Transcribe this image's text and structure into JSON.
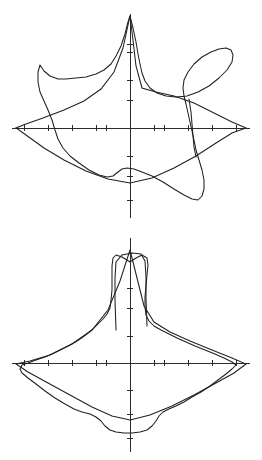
{
  "page": {
    "background_color": "#ffffff",
    "trace_color": "#231f20",
    "axis_color": "#2b2b2b",
    "figure_count": 2
  },
  "chart_data": [
    {
      "type": "line",
      "name": "upper-polar-plot",
      "title": "",
      "subtitle": "",
      "xlabel": "",
      "ylabel": "",
      "coordinate_system": "cartesian-crosshair",
      "grid": false,
      "legend": "none",
      "origin": {
        "x": 130,
        "y": 128
      },
      "axis": {
        "x_extent": [
          12,
          250
        ],
        "y_extent": [
          14,
          218
        ],
        "x_ticks": [
          24,
          48,
          72,
          96,
          106,
          154,
          164,
          188,
          212,
          236
        ],
        "y_ticks": [
          44,
          52,
          80,
          100,
          156,
          176,
          200
        ],
        "tick_length": 6,
        "tick_labels": [],
        "axis_labels_shown": false
      },
      "series": [
        {
          "name": "smooth-contour",
          "style": "smooth",
          "points": [
            [
              130,
              16
            ],
            [
              128,
              22
            ],
            [
              125,
              34
            ],
            [
              121,
              46
            ],
            [
              116,
              56
            ],
            [
              111,
              64
            ],
            [
              104,
              70
            ],
            [
              96,
              74
            ],
            [
              86,
              77
            ],
            [
              76,
              78
            ],
            [
              66,
              79
            ],
            [
              58,
              79
            ],
            [
              50,
              76
            ],
            [
              44,
              71
            ],
            [
              40,
              65
            ],
            [
              38,
              72
            ],
            [
              38,
              82
            ],
            [
              40,
              92
            ],
            [
              44,
              101
            ],
            [
              48,
              110
            ],
            [
              52,
              120
            ],
            [
              55,
              130
            ],
            [
              58,
              139
            ],
            [
              63,
              148
            ],
            [
              70,
              156
            ],
            [
              79,
              163
            ],
            [
              89,
              170
            ],
            [
              99,
              175
            ],
            [
              107,
              177
            ],
            [
              113,
              176
            ],
            [
              118,
              172
            ],
            [
              122,
              169
            ],
            [
              127,
              168
            ],
            [
              134,
              169
            ],
            [
              142,
              172
            ],
            [
              152,
              176
            ],
            [
              163,
              182
            ],
            [
              174,
              189
            ],
            [
              184,
              195
            ],
            [
              192,
              199
            ],
            [
              198,
              200
            ],
            [
              202,
              196
            ],
            [
              204,
              189
            ],
            [
              204,
              180
            ],
            [
              202,
              170
            ],
            [
              199,
              160
            ],
            [
              196,
              150
            ],
            [
              194,
              140
            ],
            [
              192,
              131
            ],
            [
              190,
              122
            ],
            [
              188,
              113
            ],
            [
              186,
              104
            ],
            [
              184,
              96
            ],
            [
              183,
              88
            ],
            [
              184,
              80
            ],
            [
              188,
              72
            ],
            [
              194,
              64
            ],
            [
              202,
              57
            ],
            [
              211,
              52
            ],
            [
              219,
              49
            ],
            [
              226,
              48
            ],
            [
              231,
              50
            ],
            [
              233,
              55
            ],
            [
              232,
              62
            ],
            [
              227,
              70
            ],
            [
              219,
              78
            ],
            [
              209,
              86
            ],
            [
              198,
              92
            ],
            [
              187,
              96
            ],
            [
              176,
              97
            ],
            [
              166,
              96
            ],
            [
              157,
              93
            ],
            [
              150,
              88
            ],
            [
              145,
              81
            ],
            [
              142,
              73
            ],
            [
              140,
              64
            ],
            [
              138,
              54
            ],
            [
              136,
              42
            ],
            [
              133,
              28
            ],
            [
              130,
              16
            ]
          ]
        },
        {
          "name": "polygonal-contour",
          "style": "angular",
          "points": [
            [
              130,
              16
            ],
            [
              123,
              48
            ],
            [
              114,
              72
            ],
            [
              101,
              89
            ],
            [
              84,
              101
            ],
            [
              64,
              110
            ],
            [
              43,
              118
            ],
            [
              26,
              124
            ],
            [
              16,
              128
            ],
            [
              26,
              135
            ],
            [
              44,
              148
            ],
            [
              64,
              160
            ],
            [
              86,
              171
            ],
            [
              108,
              179
            ],
            [
              130,
              183
            ],
            [
              152,
              178
            ],
            [
              174,
              168
            ],
            [
              196,
              156
            ],
            [
              216,
              143
            ],
            [
              232,
              133
            ],
            [
              246,
              128
            ],
            [
              232,
              122
            ],
            [
              214,
              113
            ],
            [
              194,
              103
            ],
            [
              174,
              96
            ],
            [
              156,
              92
            ],
            [
              142,
              88
            ],
            [
              136,
              66
            ],
            [
              133,
              40
            ],
            [
              130,
              16
            ]
          ]
        },
        {
          "name": "inner-radial-spur",
          "style": "angular",
          "points": [
            [
              189,
              99
            ],
            [
              191,
              112
            ],
            [
              192,
              124
            ],
            [
              193,
              136
            ],
            [
              194,
              147
            ],
            [
              196,
              157
            ]
          ]
        }
      ]
    },
    {
      "type": "line",
      "name": "lower-polar-plot",
      "title": "",
      "subtitle": "",
      "xlabel": "",
      "ylabel": "",
      "coordinate_system": "cartesian-crosshair",
      "grid": false,
      "legend": "none",
      "origin": {
        "x": 130,
        "y": 363
      },
      "axis": {
        "x_extent": [
          12,
          250
        ],
        "y_extent": [
          238,
          452
        ],
        "x_ticks": [
          24,
          48,
          72,
          96,
          106,
          154,
          164,
          188,
          212,
          236
        ],
        "y_ticks": [
          288,
          308,
          336,
          390,
          414,
          438
        ],
        "tick_length": 6,
        "tick_labels": [],
        "axis_labels_shown": false
      },
      "series": [
        {
          "name": "smooth-contour",
          "style": "smooth",
          "points": [
            [
              130,
              262
            ],
            [
              122,
              257
            ],
            [
              116,
              255
            ],
            [
              113,
              258
            ],
            [
              112,
              266
            ],
            [
              112,
              278
            ],
            [
              112,
              290
            ],
            [
              111,
              300
            ],
            [
              110,
              308
            ],
            [
              107,
              314
            ],
            [
              103,
              319
            ],
            [
              98,
              324
            ],
            [
              93,
              329
            ],
            [
              88,
              333
            ],
            [
              83,
              337
            ],
            [
              77,
              341
            ],
            [
              70,
              345
            ],
            [
              62,
              349
            ],
            [
              54,
              353
            ],
            [
              45,
              357
            ],
            [
              36,
              360
            ],
            [
              28,
              363
            ],
            [
              22,
              365
            ],
            [
              20,
              369
            ],
            [
              22,
              373
            ],
            [
              28,
              378
            ],
            [
              36,
              384
            ],
            [
              45,
              391
            ],
            [
              55,
              398
            ],
            [
              65,
              404
            ],
            [
              74,
              409
            ],
            [
              82,
              412
            ],
            [
              90,
              414
            ],
            [
              96,
              417
            ],
            [
              101,
              421
            ],
            [
              105,
              426
            ],
            [
              110,
              430
            ],
            [
              116,
              432
            ],
            [
              124,
              433
            ],
            [
              132,
              433
            ],
            [
              140,
              432
            ],
            [
              147,
              430
            ],
            [
              152,
              426
            ],
            [
              156,
              421
            ],
            [
              159,
              416
            ],
            [
              163,
              412
            ],
            [
              169,
              409
            ],
            [
              176,
              406
            ],
            [
              184,
              402
            ],
            [
              192,
              397
            ],
            [
              201,
              392
            ],
            [
              210,
              386
            ],
            [
              218,
              380
            ],
            [
              226,
              374
            ],
            [
              232,
              369
            ],
            [
              236,
              365
            ],
            [
              232,
              362
            ],
            [
              224,
              358
            ],
            [
              215,
              354
            ],
            [
              205,
              350
            ],
            [
              195,
              346
            ],
            [
              186,
              342
            ],
            [
              177,
              338
            ],
            [
              169,
              334
            ],
            [
              161,
              330
            ],
            [
              154,
              326
            ],
            [
              149,
              321
            ],
            [
              146,
              315
            ],
            [
              145,
              307
            ],
            [
              145,
              297
            ],
            [
              146,
              286
            ],
            [
              147,
              275
            ],
            [
              148,
              265
            ],
            [
              147,
              258
            ],
            [
              142,
              255
            ],
            [
              136,
              258
            ],
            [
              130,
              262
            ]
          ]
        },
        {
          "name": "polygonal-contour",
          "style": "angular",
          "points": [
            [
              130,
              250
            ],
            [
              120,
              281
            ],
            [
              108,
              310
            ],
            [
              92,
              330
            ],
            [
              72,
              344
            ],
            [
              50,
              355
            ],
            [
              30,
              361
            ],
            [
              16,
              364
            ],
            [
              28,
              372
            ],
            [
              48,
              383
            ],
            [
              70,
              395
            ],
            [
              92,
              407
            ],
            [
              112,
              416
            ],
            [
              130,
              420
            ],
            [
              150,
              415
            ],
            [
              172,
              406
            ],
            [
              194,
              395
            ],
            [
              216,
              383
            ],
            [
              234,
              373
            ],
            [
              246,
              364
            ],
            [
              232,
              358
            ],
            [
              212,
              350
            ],
            [
              190,
              341
            ],
            [
              170,
              332
            ],
            [
              154,
              322
            ],
            [
              144,
              306
            ],
            [
              137,
              278
            ],
            [
              130,
              250
            ]
          ]
        },
        {
          "name": "flat-top-spike",
          "style": "angular",
          "points": [
            [
              116,
              330
            ],
            [
              115,
              300
            ],
            [
              115,
              278
            ],
            [
              116,
              262
            ],
            [
              122,
              255
            ],
            [
              132,
              253
            ],
            [
              141,
              254
            ],
            [
              145,
              261
            ],
            [
              146,
              277
            ],
            [
              146,
              299
            ],
            [
              147,
              326
            ]
          ]
        }
      ]
    }
  ]
}
